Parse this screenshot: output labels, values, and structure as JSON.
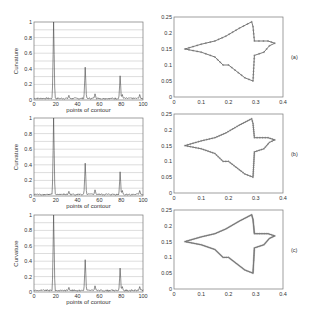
{
  "chart_data": [
    {
      "type": "line",
      "panel": "a",
      "xlabel": "points of contour",
      "ylabel": "Curvature",
      "xlim": [
        0,
        100
      ],
      "ylim": [
        0,
        1
      ],
      "xticks": [
        "0",
        "20",
        "40",
        "60",
        "80",
        "100"
      ],
      "yticks": [
        "0",
        "0.2",
        "0.4",
        "0.6",
        "0.8",
        "1"
      ],
      "grid": "horizontal",
      "peaks": [
        {
          "x": 18,
          "y": 1.0
        },
        {
          "x": 47,
          "y": 0.42
        },
        {
          "x": 79,
          "y": 0.31
        }
      ],
      "minor_peaks": [
        {
          "x": 32,
          "y": 0.06
        },
        {
          "x": 56,
          "y": 0.08
        },
        {
          "x": 81,
          "y": 0.07
        },
        {
          "x": 97,
          "y": 0.07
        }
      ]
    },
    {
      "type": "line",
      "panel": "b",
      "xlabel": "points of contour",
      "ylabel": "Curvature",
      "xlim": [
        0,
        100
      ],
      "ylim": [
        0,
        1
      ],
      "xticks": [
        "0",
        "20",
        "40",
        "60",
        "80",
        "100"
      ],
      "yticks": [
        "0",
        "0.2",
        "0.4",
        "0.6",
        "0.8",
        "1"
      ],
      "grid": "horizontal",
      "peaks": [
        {
          "x": 18,
          "y": 1.0
        },
        {
          "x": 47,
          "y": 0.42
        },
        {
          "x": 79,
          "y": 0.31
        }
      ],
      "minor_peaks": [
        {
          "x": 32,
          "y": 0.06
        },
        {
          "x": 56,
          "y": 0.08
        },
        {
          "x": 81,
          "y": 0.07
        },
        {
          "x": 97,
          "y": 0.07
        }
      ]
    },
    {
      "type": "line",
      "panel": "c",
      "xlabel": "points of contour",
      "ylabel": "Curvature",
      "xlim": [
        0,
        100
      ],
      "ylim": [
        0,
        1
      ],
      "xticks": [
        "0",
        "20",
        "40",
        "60",
        "80",
        "100"
      ],
      "yticks": [
        "0",
        "0.2",
        "0.4",
        "0.6",
        "0.8",
        "1"
      ],
      "grid": "horizontal",
      "peaks": [
        {
          "x": 18,
          "y": 1.0
        },
        {
          "x": 47,
          "y": 0.42
        },
        {
          "x": 79,
          "y": 0.31
        }
      ],
      "minor_peaks": [
        {
          "x": 32,
          "y": 0.06
        },
        {
          "x": 56,
          "y": 0.08
        },
        {
          "x": 81,
          "y": 0.07
        },
        {
          "x": 97,
          "y": 0.07
        }
      ]
    },
    {
      "type": "scatter",
      "panel": "a",
      "label": "(a)",
      "xlim": [
        0,
        0.4
      ],
      "ylim": [
        0,
        0.25
      ],
      "xticks": [
        "0",
        "0.1",
        "0.2",
        "0.3",
        "0.4"
      ],
      "yticks": [
        "0",
        "0.05",
        "0.1",
        "0.15",
        "0.2",
        "0.25"
      ],
      "contour": [
        [
          0.04,
          0.15
        ],
        [
          0.1,
          0.165
        ],
        [
          0.15,
          0.175
        ],
        [
          0.19,
          0.19
        ],
        [
          0.24,
          0.215
        ],
        [
          0.285,
          0.235
        ],
        [
          0.29,
          0.22
        ],
        [
          0.295,
          0.175
        ],
        [
          0.345,
          0.175
        ],
        [
          0.37,
          0.168
        ],
        [
          0.35,
          0.16
        ],
        [
          0.33,
          0.14
        ],
        [
          0.295,
          0.13
        ],
        [
          0.29,
          0.05
        ],
        [
          0.26,
          0.06
        ],
        [
          0.2,
          0.1
        ],
        [
          0.18,
          0.1
        ],
        [
          0.15,
          0.125
        ],
        [
          0.1,
          0.14
        ],
        [
          0.04,
          0.15
        ]
      ]
    },
    {
      "type": "scatter",
      "panel": "b",
      "label": "(b)",
      "xlim": [
        0,
        0.4
      ],
      "ylim": [
        0,
        0.25
      ],
      "xticks": [
        "0",
        "0.1",
        "0.2",
        "0.3",
        "0.4"
      ],
      "yticks": [
        "0",
        "0.05",
        "0.1",
        "0.15",
        "0.2",
        "0.25"
      ],
      "contour": [
        [
          0.04,
          0.15
        ],
        [
          0.1,
          0.165
        ],
        [
          0.15,
          0.175
        ],
        [
          0.19,
          0.19
        ],
        [
          0.24,
          0.215
        ],
        [
          0.285,
          0.235
        ],
        [
          0.29,
          0.22
        ],
        [
          0.295,
          0.175
        ],
        [
          0.345,
          0.175
        ],
        [
          0.37,
          0.168
        ],
        [
          0.35,
          0.16
        ],
        [
          0.33,
          0.14
        ],
        [
          0.295,
          0.13
        ],
        [
          0.29,
          0.05
        ],
        [
          0.26,
          0.06
        ],
        [
          0.2,
          0.1
        ],
        [
          0.18,
          0.1
        ],
        [
          0.15,
          0.125
        ],
        [
          0.1,
          0.14
        ],
        [
          0.04,
          0.15
        ]
      ]
    },
    {
      "type": "scatter",
      "panel": "c",
      "label": "(c)",
      "xlim": [
        0,
        0.4
      ],
      "ylim": [
        0,
        0.25
      ],
      "xticks": [
        "0",
        "0.1",
        "0.2",
        "0.3",
        "0.4"
      ],
      "yticks": [
        "0",
        "0.05",
        "0.1",
        "0.15",
        "0.2",
        "0.25"
      ],
      "contour": [
        [
          0.04,
          0.15
        ],
        [
          0.1,
          0.165
        ],
        [
          0.15,
          0.175
        ],
        [
          0.19,
          0.19
        ],
        [
          0.24,
          0.215
        ],
        [
          0.285,
          0.235
        ],
        [
          0.29,
          0.22
        ],
        [
          0.295,
          0.175
        ],
        [
          0.345,
          0.175
        ],
        [
          0.37,
          0.168
        ],
        [
          0.35,
          0.16
        ],
        [
          0.33,
          0.14
        ],
        [
          0.295,
          0.13
        ],
        [
          0.29,
          0.05
        ],
        [
          0.26,
          0.06
        ],
        [
          0.2,
          0.1
        ],
        [
          0.18,
          0.1
        ],
        [
          0.15,
          0.125
        ],
        [
          0.1,
          0.14
        ],
        [
          0.04,
          0.15
        ]
      ]
    }
  ],
  "labels": {
    "xlabel": "points of contour",
    "ylabel": "Curvature",
    "panel_a": "(a)",
    "panel_b": "(b)",
    "panel_c": "(c)"
  }
}
